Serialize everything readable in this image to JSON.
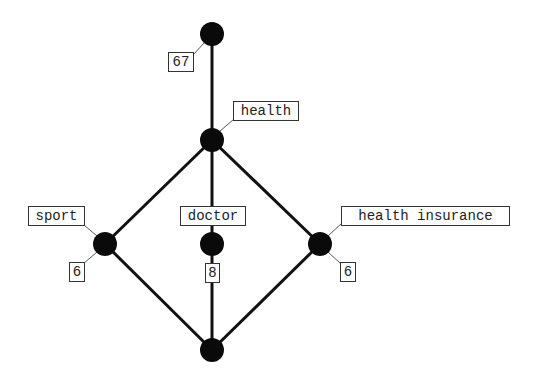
{
  "diagram": {
    "type": "concept-lattice",
    "nodes": [
      {
        "id": "top",
        "cx": 212,
        "cy": 34,
        "r": 12,
        "count": "67",
        "concept": null
      },
      {
        "id": "health",
        "cx": 212,
        "cy": 140,
        "r": 12,
        "count": null,
        "concept": "health"
      },
      {
        "id": "sport",
        "cx": 105,
        "cy": 244,
        "r": 12,
        "count": "6",
        "concept": "sport"
      },
      {
        "id": "doctor",
        "cx": 212,
        "cy": 244,
        "r": 12,
        "count": "8",
        "concept": "doctor"
      },
      {
        "id": "health-insurance",
        "cx": 320,
        "cy": 244,
        "r": 12,
        "count": "6",
        "concept": "health insurance"
      },
      {
        "id": "bottom",
        "cx": 212,
        "cy": 350,
        "r": 12,
        "count": null,
        "concept": null
      }
    ],
    "edges": [
      {
        "from": "top",
        "to": "health"
      },
      {
        "from": "health",
        "to": "sport"
      },
      {
        "from": "health",
        "to": "doctor"
      },
      {
        "from": "health",
        "to": "health-insurance"
      },
      {
        "from": "sport",
        "to": "bottom"
      },
      {
        "from": "doctor",
        "to": "bottom"
      },
      {
        "from": "health-insurance",
        "to": "bottom"
      }
    ],
    "labels": {
      "top_count": "67",
      "health_concept": "health",
      "sport_concept": "sport",
      "sport_count": "6",
      "doctor_concept": "doctor",
      "doctor_count": "8",
      "health_insurance_concept": "health insurance",
      "health_insurance_count": "6"
    },
    "colors": {
      "node": "#0a0a0a",
      "edge": "#111111",
      "label_border": "#333333",
      "background": "#ffffff"
    }
  }
}
